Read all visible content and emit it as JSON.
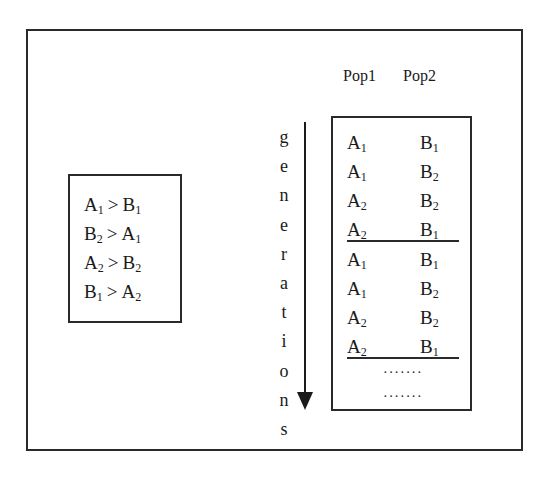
{
  "diagram": {
    "type": "coevolution-dominance-cycle",
    "rules_box": {
      "rules": [
        {
          "left": "A",
          "left_sub": "1",
          "op": ">",
          "right": "B",
          "right_sub": "1"
        },
        {
          "left": "B",
          "left_sub": "2",
          "op": ">",
          "right": "A",
          "right_sub": "1"
        },
        {
          "left": "A",
          "left_sub": "2",
          "op": ">",
          "right": "B",
          "right_sub": "2"
        },
        {
          "left": "B",
          "left_sub": "1",
          "op": ">",
          "right": "A",
          "right_sub": "2"
        }
      ]
    },
    "columns": {
      "pop1": "Pop1",
      "pop2": "Pop2"
    },
    "axis_label": {
      "text": "generations",
      "letters": [
        "g",
        "e",
        "n",
        "e",
        "r",
        "a",
        "t",
        "i",
        "o",
        "n",
        "s"
      ],
      "direction": "down"
    },
    "cycles": [
      {
        "rows": [
          {
            "a": "A",
            "a_sub": "1",
            "b": "B",
            "b_sub": "1"
          },
          {
            "a": "A",
            "a_sub": "1",
            "b": "B",
            "b_sub": "2"
          },
          {
            "a": "A",
            "a_sub": "2",
            "b": "B",
            "b_sub": "2"
          },
          {
            "a": "A",
            "a_sub": "2",
            "b": "B",
            "b_sub": "1"
          }
        ]
      },
      {
        "rows": [
          {
            "a": "A",
            "a_sub": "1",
            "b": "B",
            "b_sub": "1"
          },
          {
            "a": "A",
            "a_sub": "1",
            "b": "B",
            "b_sub": "2"
          },
          {
            "a": "A",
            "a_sub": "2",
            "b": "B",
            "b_sub": "2"
          },
          {
            "a": "A",
            "a_sub": "2",
            "b": "B",
            "b_sub": "1"
          }
        ]
      }
    ],
    "continuation": [
      "·······",
      "·······"
    ]
  }
}
